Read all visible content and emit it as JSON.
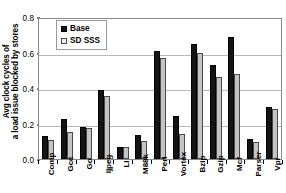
{
  "chart_data": {
    "type": "bar",
    "title": "",
    "xlabel": "",
    "ylabel": "Avg clock cycles of a load issue blocked by stores",
    "ylabel_lines": [
      "Avg clock cycles of",
      "a load issue blocked by stores"
    ],
    "ylim": [
      0.0,
      0.8
    ],
    "ytick_labels": [
      "0.0",
      "0.2",
      "0.4",
      "0.6",
      "0.8"
    ],
    "ytick_values": [
      0.0,
      0.2,
      0.4,
      0.6,
      0.8
    ],
    "grid": true,
    "grid_axis": "y",
    "legend_position": "upper-left-inside",
    "categories": [
      "Comp",
      "Gcc",
      "Go",
      "Ijpeg",
      "Li",
      "M88k",
      "Perl",
      "Vortex",
      "Bzip",
      "Gzip",
      "Mcf",
      "Parser",
      "Vpr"
    ],
    "series": [
      {
        "name": "Base",
        "color": "#141414",
        "values": [
          0.13,
          0.225,
          0.18,
          0.39,
          0.065,
          0.135,
          0.61,
          0.245,
          0.65,
          0.53,
          0.69,
          0.115,
          0.295
        ]
      },
      {
        "name": "SD SSS",
        "color": "#c4c4c4",
        "values": [
          0.105,
          0.155,
          0.175,
          0.355,
          0.07,
          0.1,
          0.57,
          0.14,
          0.595,
          0.46,
          0.48,
          0.095,
          0.28
        ]
      }
    ]
  },
  "legend": {
    "items": [
      {
        "label": "Base",
        "swatch": "base"
      },
      {
        "label": "SD SSS",
        "swatch": "sd"
      }
    ]
  },
  "colors": {
    "base_bar": "#141414",
    "sd_bar": "#c4c4c4",
    "gridline": "#b9b9b9",
    "axis": "#8a8a8a",
    "text": "#000000",
    "background": "#ffffff"
  }
}
